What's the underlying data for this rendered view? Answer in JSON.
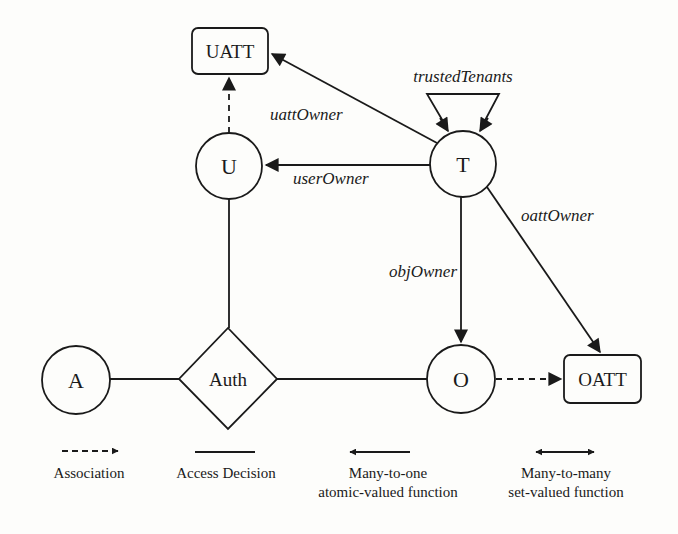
{
  "nodes": {
    "U": "U",
    "T": "T",
    "O": "O",
    "A": "A",
    "Auth": "Auth",
    "UATT": "UATT",
    "OATT": "OATT"
  },
  "edges": {
    "uattOwner": "uattOwner",
    "userOwner": "userOwner",
    "trustedTenants": "trustedTenants",
    "oattOwner": "oattOwner",
    "objOwner": "objOwner"
  },
  "legend": {
    "association": "Association",
    "access_decision": "Access Decision",
    "many_to_one_line1": "Many-to-one",
    "many_to_one_line2": "atomic-valued function",
    "many_to_many_line1": "Many-to-many",
    "many_to_many_line2": "set-valued function"
  },
  "colors": {
    "ink": "#1a1a1a",
    "background": "#fdfdfb"
  }
}
